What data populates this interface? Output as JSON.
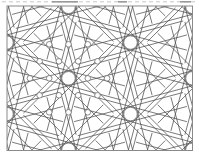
{
  "figure": {
    "name": "star-polygon-lattice-pattern",
    "background": "#ffffff",
    "frame": {
      "x": 7,
      "y": 6,
      "width": 185.5,
      "height": 144.5,
      "stroke": "#8a8a8a",
      "stroke_width": 1
    },
    "top_artifact": {
      "y": 1.8,
      "base_color": "#c6c6c6",
      "dark_color": "#9a9a9a",
      "x_start": 2,
      "x_end": 197,
      "dash": "4 3",
      "dark_segments": [
        [
          52,
          78
        ],
        [
          118,
          127
        ],
        [
          180,
          191
        ]
      ]
    },
    "line_color": "#4d4d4d",
    "line_width": 0.75,
    "circle_color": "#6f6f6f",
    "star": {
      "points": 12,
      "radius": 28,
      "chord_step": 5,
      "chord_extension": 29,
      "phase_deg": 0,
      "ring_radius": 6.8,
      "ring_stroke_width": 0.9
    },
    "star_centers": [
      [
        6.5,
        -28.95
      ],
      [
        130.5,
        -28.95
      ],
      [
        68.5,
        6.8
      ],
      [
        192.5,
        6.8
      ],
      [
        6.5,
        42.55
      ],
      [
        130.5,
        42.55
      ],
      [
        68.5,
        78.3
      ],
      [
        192.5,
        78.3
      ],
      [
        6.5,
        114.05
      ],
      [
        130.5,
        114.05
      ],
      [
        68.5,
        149.8
      ],
      [
        192.5,
        149.8
      ],
      [
        6.5,
        185.55
      ],
      [
        130.5,
        185.55
      ]
    ],
    "small_circles": {
      "radius": 2.8,
      "stroke_width": 0.8,
      "centers": [
        [
          49.2,
          44.3
        ],
        [
          68.5,
          44.3
        ],
        [
          87.8,
          44.3
        ],
        [
          39.6,
          61.3
        ],
        [
          58.9,
          61.3
        ],
        [
          78.2,
          61.3
        ],
        [
          97.5,
          61.3
        ],
        [
          29.9,
          78.3
        ],
        [
          49.2,
          78.3
        ],
        [
          87.8,
          78.3
        ],
        [
          107.1,
          78.3
        ],
        [
          39.6,
          95.3
        ],
        [
          58.9,
          95.3
        ],
        [
          78.2,
          95.3
        ],
        [
          97.5,
          95.3
        ],
        [
          49.2,
          112.3
        ],
        [
          68.5,
          112.3
        ],
        [
          87.8,
          112.3
        ]
      ]
    }
  }
}
